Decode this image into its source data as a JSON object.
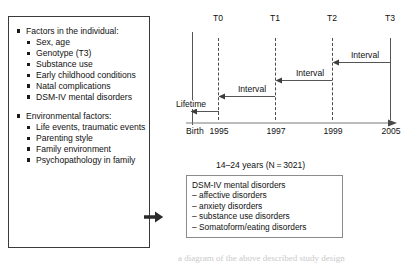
{
  "figure": {
    "factors_box": {
      "groups": [
        {
          "heading": "Factors in the individual:",
          "items": [
            "Sex, age",
            "Genotype (T3)",
            "Substance use",
            "Early childhood conditions",
            "Natal complications",
            "DSM-IV mental disorders"
          ]
        },
        {
          "heading": "Environmental factors:",
          "items": [
            "Life events, traumatic events",
            "Parenting style",
            "Family environment",
            "Psychopathology in family"
          ]
        }
      ]
    },
    "timeline": {
      "wave_labels": [
        "T0",
        "T1",
        "T2",
        "T3"
      ],
      "year_labels": [
        "1995",
        "1997",
        "1999",
        "2005"
      ],
      "origin_label": "Birth",
      "lifetime_label": "Lifetime",
      "interval_labels": [
        "Interval",
        "Interval",
        "Interval"
      ]
    },
    "sample_label": "14–24 years (N = 3021)",
    "outcome_box": {
      "title": "DSM-IV mental disorders",
      "items": [
        "– affective disorders",
        "– anxiety disorders",
        "– substance use disorders",
        "– Somatoform/eating disorders"
      ]
    },
    "caption_remnant": "a diagram of the above described study design",
    "colors": {
      "ink": "#1a1a1a",
      "box_border": "#3a3a3a",
      "outcome_border": "#8b8b8b",
      "axis": "#555555",
      "dashed": "#4a4a4a"
    }
  }
}
